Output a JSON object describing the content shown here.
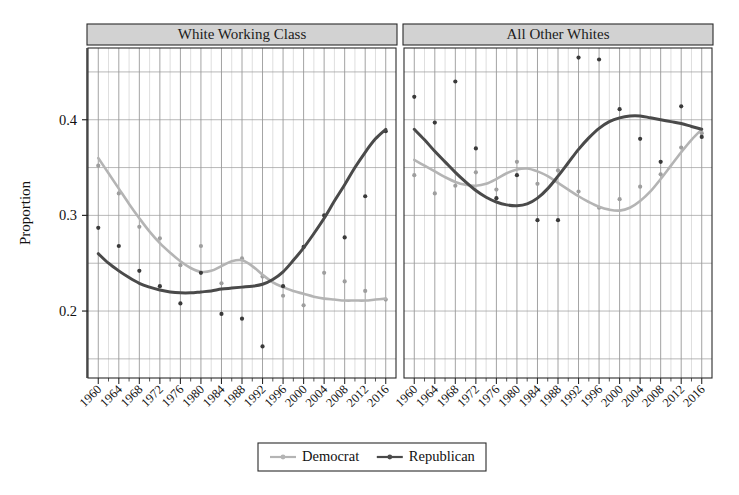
{
  "chart_data": {
    "type": "scatter",
    "title": "",
    "xlabel": "",
    "ylabel": "Proportion",
    "xlim": [
      1958,
      2018
    ],
    "ylim": [
      0.13,
      0.475
    ],
    "grid": true,
    "y_ticks": [
      "0.2",
      "0.3",
      "0.4"
    ],
    "y_tick_values": [
      0.2,
      0.3,
      0.4
    ],
    "y_gridlines": [
      0.15,
      0.2,
      0.25,
      0.3,
      0.35,
      0.4,
      0.45
    ],
    "x_ticks": [
      "1960",
      "1964",
      "1968",
      "1972",
      "1976",
      "1980",
      "1984",
      "1988",
      "1992",
      "1996",
      "2000",
      "2004",
      "2008",
      "2012",
      "2016"
    ],
    "x_tick_values": [
      1960,
      1964,
      1968,
      1972,
      1976,
      1980,
      1984,
      1988,
      1992,
      1996,
      2000,
      2004,
      2008,
      2012,
      2016
    ],
    "x_minor_step": 2,
    "legend_position": "bottom",
    "legend_entries": [
      {
        "name": "Democrat",
        "color": "#b4b4b4",
        "marker": "circle"
      },
      {
        "name": "Republican",
        "color": "#4a4a4a",
        "marker": "circle"
      }
    ],
    "panels": [
      {
        "label": "White Working Class",
        "series": [
          {
            "name": "Democrat",
            "color": "#b4b4b4",
            "fit": {
              "x": [
                1960,
                1962,
                1964,
                1966,
                1968,
                1970,
                1972,
                1974,
                1976,
                1978,
                1980,
                1982,
                1984,
                1986,
                1988,
                1990,
                1992,
                1994,
                1996,
                1998,
                2000,
                2002,
                2004,
                2006,
                2008,
                2010,
                2012,
                2014,
                2016
              ],
              "y": [
                0.36,
                0.344,
                0.328,
                0.312,
                0.297,
                0.283,
                0.271,
                0.261,
                0.252,
                0.245,
                0.241,
                0.242,
                0.247,
                0.252,
                0.253,
                0.247,
                0.238,
                0.23,
                0.225,
                0.221,
                0.218,
                0.215,
                0.213,
                0.212,
                0.211,
                0.211,
                0.211,
                0.212,
                0.213
              ]
            },
            "points": {
              "x": [
                1960,
                1964,
                1968,
                1972,
                1976,
                1980,
                1984,
                1988,
                1992,
                1996,
                2000,
                2004,
                2008,
                2012,
                2016
              ],
              "y": [
                0.352,
                0.323,
                0.288,
                0.276,
                0.248,
                0.268,
                0.229,
                0.255,
                0.236,
                0.216,
                0.206,
                0.24,
                0.231,
                0.221,
                0.212
              ]
            }
          },
          {
            "name": "Republican",
            "color": "#4a4a4a",
            "fit": {
              "x": [
                1960,
                1962,
                1964,
                1966,
                1968,
                1970,
                1972,
                1974,
                1976,
                1978,
                1980,
                1982,
                1984,
                1986,
                1988,
                1990,
                1992,
                1994,
                1996,
                1998,
                2000,
                2002,
                2004,
                2006,
                2008,
                2010,
                2012,
                2014,
                2016
              ],
              "y": [
                0.26,
                0.25,
                0.242,
                0.235,
                0.229,
                0.225,
                0.222,
                0.22,
                0.219,
                0.219,
                0.22,
                0.221,
                0.223,
                0.224,
                0.225,
                0.226,
                0.228,
                0.233,
                0.241,
                0.253,
                0.266,
                0.281,
                0.297,
                0.315,
                0.332,
                0.35,
                0.366,
                0.38,
                0.39
              ]
            },
            "points": {
              "x": [
                1960,
                1964,
                1968,
                1972,
                1976,
                1980,
                1984,
                1988,
                1992,
                1996,
                2000,
                2004,
                2008,
                2012,
                2016
              ],
              "y": [
                0.287,
                0.268,
                0.242,
                0.226,
                0.208,
                0.24,
                0.197,
                0.192,
                0.163,
                0.226,
                0.267,
                0.3,
                0.277,
                0.32,
                0.388
              ]
            }
          }
        ]
      },
      {
        "label": "All Other Whites",
        "series": [
          {
            "name": "Democrat",
            "color": "#b4b4b4",
            "fit": {
              "x": [
                1960,
                1962,
                1964,
                1966,
                1968,
                1970,
                1972,
                1974,
                1976,
                1978,
                1980,
                1982,
                1984,
                1986,
                1988,
                1990,
                1992,
                1994,
                1996,
                1998,
                2000,
                2002,
                2004,
                2006,
                2008,
                2010,
                2012,
                2014,
                2016
              ],
              "y": [
                0.358,
                0.352,
                0.346,
                0.34,
                0.335,
                0.332,
                0.331,
                0.333,
                0.338,
                0.344,
                0.348,
                0.349,
                0.346,
                0.341,
                0.334,
                0.327,
                0.32,
                0.314,
                0.309,
                0.306,
                0.305,
                0.308,
                0.315,
                0.325,
                0.338,
                0.352,
                0.366,
                0.379,
                0.39
              ]
            },
            "points": {
              "x": [
                1960,
                1964,
                1968,
                1972,
                1976,
                1980,
                1984,
                1988,
                1992,
                1996,
                2000,
                2004,
                2008,
                2012,
                2016
              ],
              "y": [
                0.342,
                0.323,
                0.331,
                0.345,
                0.327,
                0.356,
                0.333,
                0.347,
                0.325,
                0.308,
                0.317,
                0.33,
                0.343,
                0.371,
                0.386
              ]
            }
          },
          {
            "name": "Republican",
            "color": "#4a4a4a",
            "fit": {
              "x": [
                1960,
                1962,
                1964,
                1966,
                1968,
                1970,
                1972,
                1974,
                1976,
                1978,
                1980,
                1982,
                1984,
                1986,
                1988,
                1990,
                1992,
                1994,
                1996,
                1998,
                2000,
                2002,
                2004,
                2006,
                2008,
                2010,
                2012,
                2014,
                2016
              ],
              "y": [
                0.39,
                0.379,
                0.367,
                0.356,
                0.345,
                0.335,
                0.326,
                0.319,
                0.314,
                0.311,
                0.31,
                0.312,
                0.318,
                0.328,
                0.341,
                0.355,
                0.369,
                0.381,
                0.391,
                0.398,
                0.402,
                0.404,
                0.404,
                0.402,
                0.4,
                0.398,
                0.396,
                0.393,
                0.39
              ]
            },
            "points": {
              "x": [
                1960,
                1964,
                1968,
                1972,
                1976,
                1980,
                1984,
                1988,
                1992,
                1996,
                2000,
                2004,
                2008,
                2012,
                2016
              ],
              "y": [
                0.424,
                0.397,
                0.44,
                0.37,
                0.318,
                0.342,
                0.295,
                0.295,
                0.465,
                0.463,
                0.411,
                0.38,
                0.356,
                0.414,
                0.382
              ]
            }
          }
        ]
      }
    ]
  },
  "legend": {
    "democrat_label": "Democrat",
    "republican_label": "Republican"
  },
  "axes": {
    "y_title": "Proportion"
  }
}
